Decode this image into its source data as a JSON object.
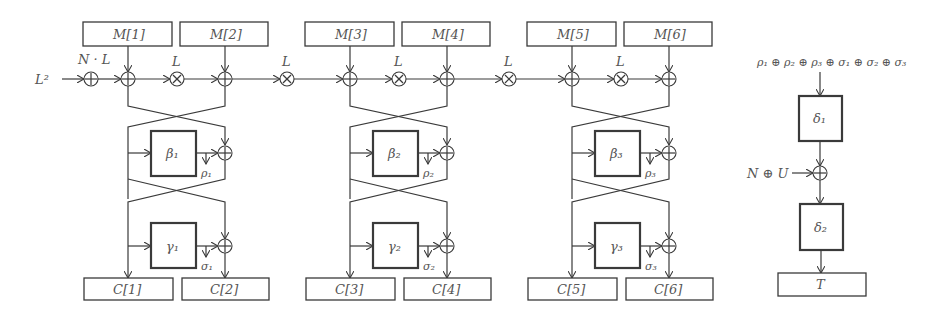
{
  "diagram": {
    "input_label": "L²",
    "nonce_label": "N · L",
    "mult_label": "L",
    "message_blocks": [
      "M[1]",
      "M[2]",
      "M[3]",
      "M[4]",
      "M[5]",
      "M[6]"
    ],
    "ciphertext_blocks": [
      "C[1]",
      "C[2]",
      "C[3]",
      "C[4]",
      "C[5]",
      "C[6]"
    ],
    "rounds": [
      {
        "beta": "β₁",
        "gamma": "γ₁",
        "rho": "ρ₁",
        "sigma": "σ₁"
      },
      {
        "beta": "β₂",
        "gamma": "γ₂",
        "rho": "ρ₂",
        "sigma": "σ₂"
      },
      {
        "beta": "β₃",
        "gamma": "γ₃",
        "rho": "ρ₃",
        "sigma": "σ₃"
      }
    ],
    "tag_path": {
      "top_label": "ρ₁ ⊕ ρ₂ ⊕ ρ₃ ⊕ σ₁ ⊕ σ₂ ⊕ σ₃",
      "delta1": "δ₁",
      "side_input": "N ⊕ U",
      "delta2": "δ₂",
      "tag": "T"
    },
    "operators": {
      "xor": "+",
      "mult": "×"
    }
  }
}
